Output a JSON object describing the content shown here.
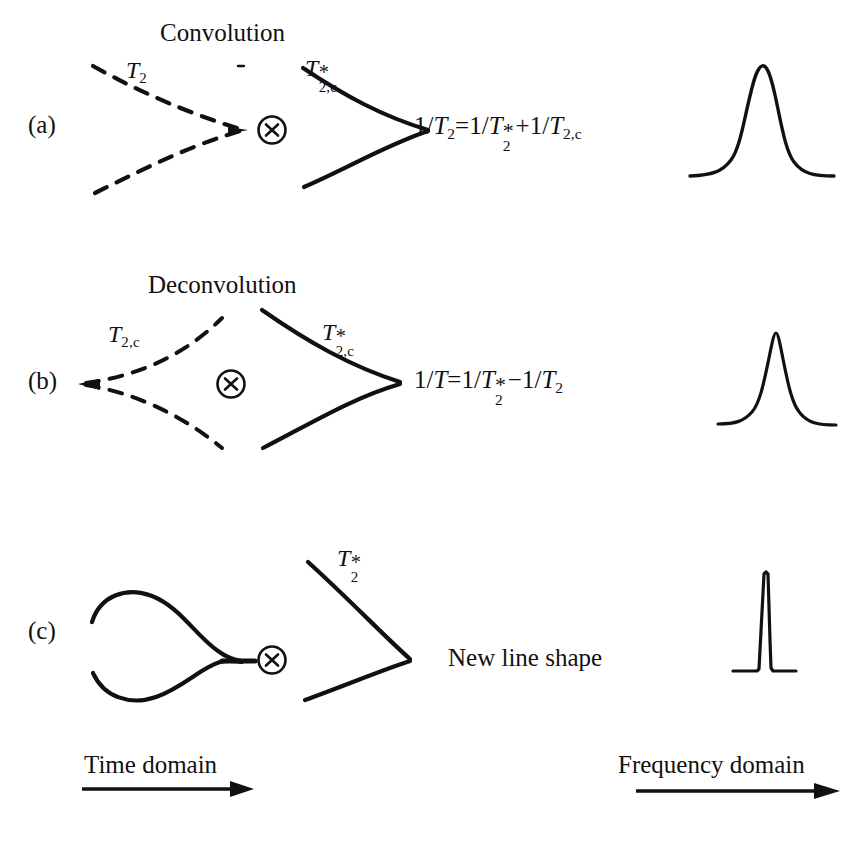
{
  "figure": {
    "title_a": "Convolution",
    "title_b": "Deconvolution",
    "panels": [
      {
        "id": "a",
        "letter": "(a)",
        "section_title": "Convolution",
        "dashed_curve_label": {
          "base": "T",
          "sub": "2",
          "star": ""
        },
        "solid_curve_label": {
          "base": "T",
          "sub": "2,c",
          "star": "*"
        },
        "operator": "circled-times",
        "operator_glyph": "x",
        "equation": "1/T2 = 1/T2* + 1/T2,c",
        "equation_parts": {
          "lhs_base": "T",
          "lhs_sub": "2",
          "relation": "=",
          "term1_base": "T",
          "term1_sub": "2",
          "term1_star": "*",
          "op": "+",
          "term2_base": "T",
          "term2_sub": "2,c"
        },
        "peak": {
          "name": "broad-lorentzian-peak",
          "width_class": "broad",
          "relative_width": 1.0,
          "relative_height": 1.0
        }
      },
      {
        "id": "b",
        "letter": "(b)",
        "section_title": "Deconvolution",
        "dashed_curve_label": {
          "base": "T",
          "sub": "2,c",
          "star": ""
        },
        "solid_curve_label": {
          "base": "T",
          "sub": "2,c",
          "star": "*"
        },
        "operator": "circled-times",
        "operator_glyph": "x",
        "equation": "1/T = 1/T2* - 1/T2",
        "equation_parts": {
          "lhs_base": "T",
          "lhs_sub": "",
          "relation": "=",
          "term1_base": "T",
          "term1_sub": "2",
          "term1_star": "*",
          "op": "−",
          "term2_base": "T",
          "term2_sub": "2"
        },
        "peak": {
          "name": "narrow-lorentzian-peak",
          "width_class": "narrow",
          "relative_width": 0.55,
          "relative_height": 1.05
        }
      },
      {
        "id": "c",
        "letter": "(c)",
        "section_title": "",
        "dashed_curve_label": null,
        "solid_curve_label": {
          "base": "T",
          "sub": "2",
          "star": "*"
        },
        "operator": "circled-times",
        "operator_glyph": "x",
        "equation": "",
        "result_text": "New line shape",
        "peak": {
          "name": "spike-peak",
          "width_class": "spike",
          "relative_width": 0.18,
          "relative_height": 1.1
        }
      }
    ],
    "axes": {
      "time_domain_label": "Time domain",
      "frequency_domain_label": "Frequency domain"
    },
    "colors": {
      "ink": "#111111",
      "background": "#ffffff"
    }
  }
}
